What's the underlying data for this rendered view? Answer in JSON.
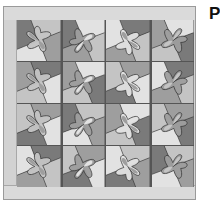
{
  "image": {
    "subject": "quilt-pattern",
    "grid": {
      "rows": 4,
      "cols": 4
    },
    "colors": {
      "dark": "#7a7a7a",
      "medium": "#9e9e9e",
      "light": "#c4c4c4",
      "lightest": "#e2e2e2",
      "border": "#d8d8d8",
      "outline": "#333333"
    }
  },
  "label": {
    "text": "P"
  }
}
